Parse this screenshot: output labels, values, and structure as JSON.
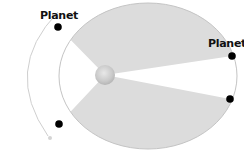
{
  "diagram": {
    "title": "",
    "type": "kepler-second-law-orbit",
    "labels": {
      "planet_top_left": "Planet",
      "planet_right": "Planet"
    },
    "elements": {
      "orbit": "elliptical-orbit",
      "star": "sun",
      "sectors": [
        "swept-area-upper",
        "swept-area-lower"
      ],
      "planet_positions": 4,
      "motion_arrow": "counterclockwise-arc-arrow"
    },
    "colors": {
      "sector_fill": "#dcdcdc",
      "orbit_stroke": "#bdbdbd",
      "planet": "#000000",
      "sun": "#cfcfcf",
      "arrow": "#cccccc",
      "label": "#111111"
    }
  }
}
